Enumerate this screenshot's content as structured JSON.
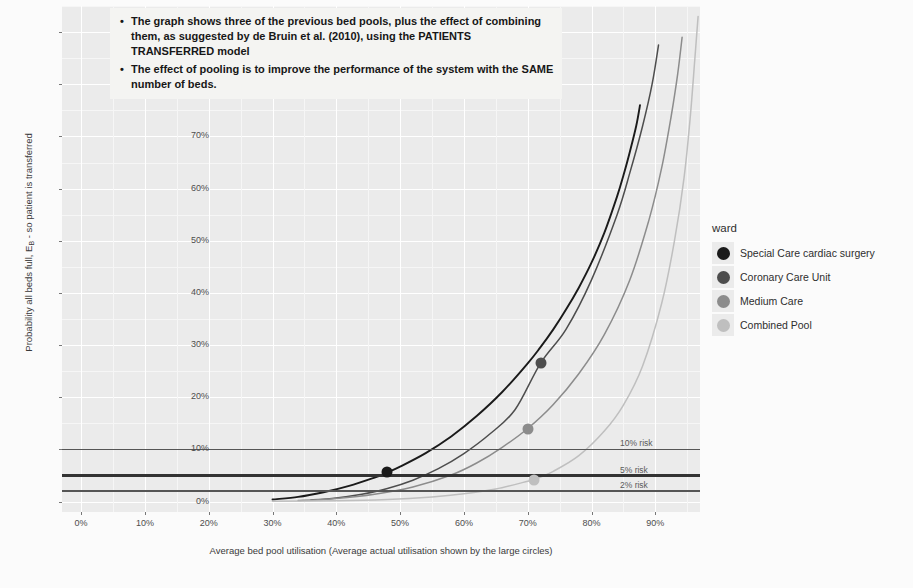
{
  "chart_data": {
    "type": "line",
    "title": "",
    "xlabel": "Average bed pool utilisation (Average actual utilisation shown by the large circles)",
    "ylabel": "Probability all beds full, E_B - so patient is transferred",
    "xlim": [
      -3,
      97
    ],
    "ylim": [
      -2,
      95
    ],
    "xticks": [
      "0%",
      "10%",
      "20%",
      "30%",
      "40%",
      "50%",
      "60%",
      "70%",
      "80%",
      "90%"
    ],
    "xtick_values": [
      0,
      10,
      20,
      30,
      40,
      50,
      60,
      70,
      80,
      90
    ],
    "yticks": [
      "0%",
      "10%",
      "20%",
      "30%",
      "40%",
      "50%",
      "60%",
      "70%",
      "80%",
      "90%"
    ],
    "ytick_values": [
      0,
      10,
      20,
      30,
      40,
      50,
      60,
      70,
      80,
      90
    ],
    "grid": true,
    "legend_position": "right",
    "legend_title": "ward",
    "series": [
      {
        "name": "Special Care cardiac surgery",
        "color": "#1a1a1a",
        "points": [
          {
            "x": 30,
            "y": 0.4
          },
          {
            "x": 34,
            "y": 0.9
          },
          {
            "x": 38,
            "y": 1.8
          },
          {
            "x": 42,
            "y": 3.0
          },
          {
            "x": 46,
            "y": 4.6
          },
          {
            "x": 48,
            "y": 5.6
          },
          {
            "x": 50,
            "y": 6.7
          },
          {
            "x": 54,
            "y": 9.3
          },
          {
            "x": 58,
            "y": 12.5
          },
          {
            "x": 62,
            "y": 16.4
          },
          {
            "x": 66,
            "y": 21.0
          },
          {
            "x": 70,
            "y": 26.5
          },
          {
            "x": 72,
            "y": 29.6
          },
          {
            "x": 74,
            "y": 33.0
          },
          {
            "x": 76,
            "y": 36.8
          },
          {
            "x": 78,
            "y": 41.0
          },
          {
            "x": 80,
            "y": 45.8
          },
          {
            "x": 82,
            "y": 51.5
          },
          {
            "x": 84,
            "y": 58.5
          },
          {
            "x": 85,
            "y": 62.5
          },
          {
            "x": 86,
            "y": 67.0
          },
          {
            "x": 87,
            "y": 72.0
          },
          {
            "x": 87.6,
            "y": 76.0
          }
        ],
        "marker": {
          "x": 48,
          "y": 5.6,
          "label": "Special Care cardiac surgery"
        }
      },
      {
        "name": "Coronary Care Unit",
        "color": "#4d4d4d",
        "points": [
          {
            "x": 36,
            "y": 0.3
          },
          {
            "x": 40,
            "y": 0.7
          },
          {
            "x": 44,
            "y": 1.4
          },
          {
            "x": 48,
            "y": 2.5
          },
          {
            "x": 52,
            "y": 4.1
          },
          {
            "x": 56,
            "y": 6.3
          },
          {
            "x": 60,
            "y": 9.2
          },
          {
            "x": 64,
            "y": 12.9
          },
          {
            "x": 68,
            "y": 17.6
          },
          {
            "x": 72,
            "y": 26.5
          },
          {
            "x": 76,
            "y": 33.0
          },
          {
            "x": 80,
            "y": 42.5
          },
          {
            "x": 84,
            "y": 55.0
          },
          {
            "x": 86,
            "y": 63.0
          },
          {
            "x": 88,
            "y": 72.0
          },
          {
            "x": 89.5,
            "y": 80.0
          },
          {
            "x": 90.5,
            "y": 87.5
          }
        ],
        "marker": {
          "x": 72,
          "y": 26.5,
          "label": "Coronary Care Unit"
        }
      },
      {
        "name": "Medium Care",
        "color": "#8c8c8c",
        "points": [
          {
            "x": 34,
            "y": 0.2
          },
          {
            "x": 40,
            "y": 0.6
          },
          {
            "x": 46,
            "y": 1.4
          },
          {
            "x": 52,
            "y": 2.8
          },
          {
            "x": 58,
            "y": 5.1
          },
          {
            "x": 62,
            "y": 7.4
          },
          {
            "x": 66,
            "y": 10.4
          },
          {
            "x": 70,
            "y": 14.0
          },
          {
            "x": 74,
            "y": 18.6
          },
          {
            "x": 78,
            "y": 24.5
          },
          {
            "x": 82,
            "y": 32.0
          },
          {
            "x": 86,
            "y": 42.5
          },
          {
            "x": 89,
            "y": 54.0
          },
          {
            "x": 91,
            "y": 64.0
          },
          {
            "x": 92.5,
            "y": 74.0
          },
          {
            "x": 93.5,
            "y": 82.0
          },
          {
            "x": 94.2,
            "y": 89.0
          }
        ],
        "marker": {
          "x": 70,
          "y": 14.0,
          "label": "Medium Care"
        }
      },
      {
        "name": "Combined Pool",
        "color": "#bfbfbf",
        "points": [
          {
            "x": 30,
            "y": 0.05
          },
          {
            "x": 40,
            "y": 0.15
          },
          {
            "x": 48,
            "y": 0.4
          },
          {
            "x": 55,
            "y": 0.9
          },
          {
            "x": 60,
            "y": 1.5
          },
          {
            "x": 65,
            "y": 2.4
          },
          {
            "x": 70,
            "y": 3.9
          },
          {
            "x": 71,
            "y": 4.2
          },
          {
            "x": 74,
            "y": 5.8
          },
          {
            "x": 78,
            "y": 8.8
          },
          {
            "x": 82,
            "y": 13.5
          },
          {
            "x": 85,
            "y": 18.5
          },
          {
            "x": 88,
            "y": 26.0
          },
          {
            "x": 91,
            "y": 38.0
          },
          {
            "x": 93,
            "y": 50.0
          },
          {
            "x": 94.5,
            "y": 62.0
          },
          {
            "x": 95.5,
            "y": 74.0
          },
          {
            "x": 96.2,
            "y": 85.0
          },
          {
            "x": 96.7,
            "y": 93.0
          }
        ],
        "marker": {
          "x": 71,
          "y": 4.2,
          "label": "Combined Pool"
        }
      }
    ],
    "reference_lines": [
      {
        "label": "10% risk",
        "value": 10,
        "color": "#555555",
        "width": 1.6
      },
      {
        "label": "5% risk",
        "value": 5,
        "color": "#333333",
        "width": 2.6
      },
      {
        "label": "2% risk",
        "value": 2,
        "color": "#555555",
        "width": 1.6
      }
    ],
    "annotations": [
      "The graph shows three of the previous bed pools, plus the effect of combining them, as suggested by de Bruin et al. (2010), using the PATIENTS TRANSFERRED model",
      "The effect of pooling is to improve the performance of the system with the SAME number of beds."
    ]
  },
  "legend": {
    "title": "ward",
    "items": [
      {
        "label": "Special Care cardiac surgery",
        "color": "#1a1a1a"
      },
      {
        "label": "Coronary Care Unit",
        "color": "#4d4d4d"
      },
      {
        "label": "Medium Care",
        "color": "#8c8c8c"
      },
      {
        "label": "Combined Pool",
        "color": "#bfbfbf"
      }
    ]
  }
}
